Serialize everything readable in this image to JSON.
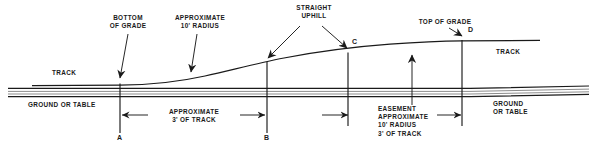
{
  "diagram": {
    "annotations": {
      "bottom_of_grade": "BOTTOM\nOF GRADE",
      "approximate_10_radius": "APPROXIMATE\n10' RADIUS",
      "straight_uphill": "STRAIGHT\nUPHILL",
      "top_of_grade": "TOP OF GRADE",
      "track_left": "TRACK",
      "track_right": "TRACK",
      "ground_or_table_left": "GROUND OR TABLE",
      "ground_or_table_right": "GROUND\nOR TABLE",
      "approximate_3_of_track": "APPROXIMATE\n3' OF TRACK",
      "easement_block": "EASEMENT\nAPPROXIMATE\n10' RADIUS\n3' OF TRACK"
    },
    "points": [
      {
        "id": "A",
        "label": "A",
        "x": 120
      },
      {
        "id": "B",
        "label": "B",
        "x": 267
      },
      {
        "id": "C",
        "label": "C",
        "x": 355
      },
      {
        "id": "D",
        "label": "D",
        "x": 470
      }
    ],
    "colors": {
      "line": "#1a1a1a",
      "background": "#ffffff",
      "text": "#1a1a1a"
    }
  }
}
